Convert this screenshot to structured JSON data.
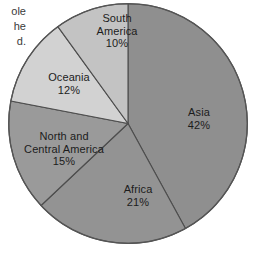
{
  "page": {
    "background_color": "#ffffff",
    "width": 257,
    "height": 253
  },
  "caption_fragments": {
    "line1": "ole",
    "line2": "he",
    "line3": "d."
  },
  "chart_data": {
    "type": "pie",
    "title": "",
    "subtitle": "",
    "xlabel": "",
    "ylabel": "",
    "legend_position": "none",
    "grid": false,
    "labels_inside_slices": true,
    "start_angle_deg": 0,
    "direction": "clockwise",
    "units": "percent",
    "total": 100,
    "categories": [
      "Asia",
      "Africa",
      "North and Central America",
      "Oceania",
      "South America"
    ],
    "values": [
      42,
      21,
      15,
      12,
      10
    ],
    "slices": [
      {
        "name": "Asia",
        "label_line1": "Asia",
        "label_line2": "42%",
        "value": 42,
        "color": "#8f8f8f",
        "start_angle_deg": 0,
        "end_angle_deg": 151.2
      },
      {
        "name": "Africa",
        "label_line1": "Africa",
        "label_line2": "21%",
        "value": 21,
        "color": "#939393",
        "start_angle_deg": 151.2,
        "end_angle_deg": 226.8
      },
      {
        "name": "North and Central America",
        "label_line1": "North and",
        "label_line1b": "Central America",
        "label_line2": "15%",
        "value": 15,
        "color": "#9a9a9a",
        "start_angle_deg": 226.8,
        "end_angle_deg": 280.8
      },
      {
        "name": "Oceania",
        "label_line1": "Oceania",
        "label_line2": "12%",
        "value": 12,
        "color": "#d2d2d2",
        "start_angle_deg": 280.8,
        "end_angle_deg": 324.0
      },
      {
        "name": "South America",
        "label_line1": "South",
        "label_line1b": "America",
        "label_line2": "10%",
        "value": 10,
        "color": "#c3c3c3",
        "start_angle_deg": 324.0,
        "end_angle_deg": 360.0
      }
    ],
    "stroke_color": "#4d4d4d"
  }
}
